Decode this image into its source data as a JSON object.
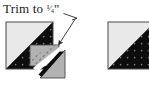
{
  "figure": {
    "annotation": {
      "text_prefix": "Trim to ",
      "fraction": "1/4",
      "unit": "\"",
      "full_text": "Trim to 1/4\"",
      "arrow": "diagonal-arrow-down-left"
    },
    "colors": {
      "light_fabric": "#e9e9e9",
      "dark_fabric": "#0d0d0d",
      "trim_overlay": "#b2b2b2",
      "outline": "#3a3a3a",
      "background": "#ffffff",
      "dot_print": "#5a5a5a",
      "text": "#1a1a1a"
    },
    "panels": [
      {
        "name": "before-trim-block",
        "caption": "",
        "description": "Half-square triangle block with trim guide square and cut-away triangle"
      },
      {
        "name": "after-trim-block",
        "caption": "",
        "description": "Finished trimmed half-square triangle unit"
      }
    ]
  }
}
